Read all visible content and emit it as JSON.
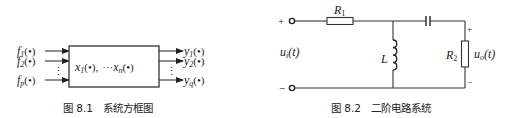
{
  "figure1": {
    "caption": "图 8.1   系统方框图",
    "inputs": [
      {
        "sym": "f",
        "sub": "1",
        "arg": "(•)"
      },
      {
        "sym": "f",
        "sub": "2",
        "arg": "(•)"
      },
      {
        "sym": "f",
        "sub": "p",
        "arg": "(•)"
      }
    ],
    "outputs": [
      {
        "sym": "y",
        "sub": "1",
        "arg": "(•)"
      },
      {
        "sym": "y",
        "sub": "2",
        "arg": "(•)"
      },
      {
        "sym": "y",
        "sub": "q",
        "arg": "(•)"
      }
    ],
    "state": {
      "first_sym": "x",
      "first_sub": "1",
      "first_arg": "(•),",
      "dots": "···",
      "last_sym": "x",
      "last_sub": "n",
      "last_arg": "(•)"
    },
    "vdots": "⋮"
  },
  "figure2": {
    "caption": "图 8.2   二阶电路系统",
    "R1": {
      "sym": "R",
      "sub": "1"
    },
    "R2": {
      "sym": "R",
      "sub": "2"
    },
    "L": "L",
    "input": {
      "sym": "u",
      "sub": "i",
      "arg": "(t)"
    },
    "output": {
      "sym": "u",
      "sub": "o",
      "arg": "(t)"
    },
    "plus": "+",
    "minus": "−"
  }
}
